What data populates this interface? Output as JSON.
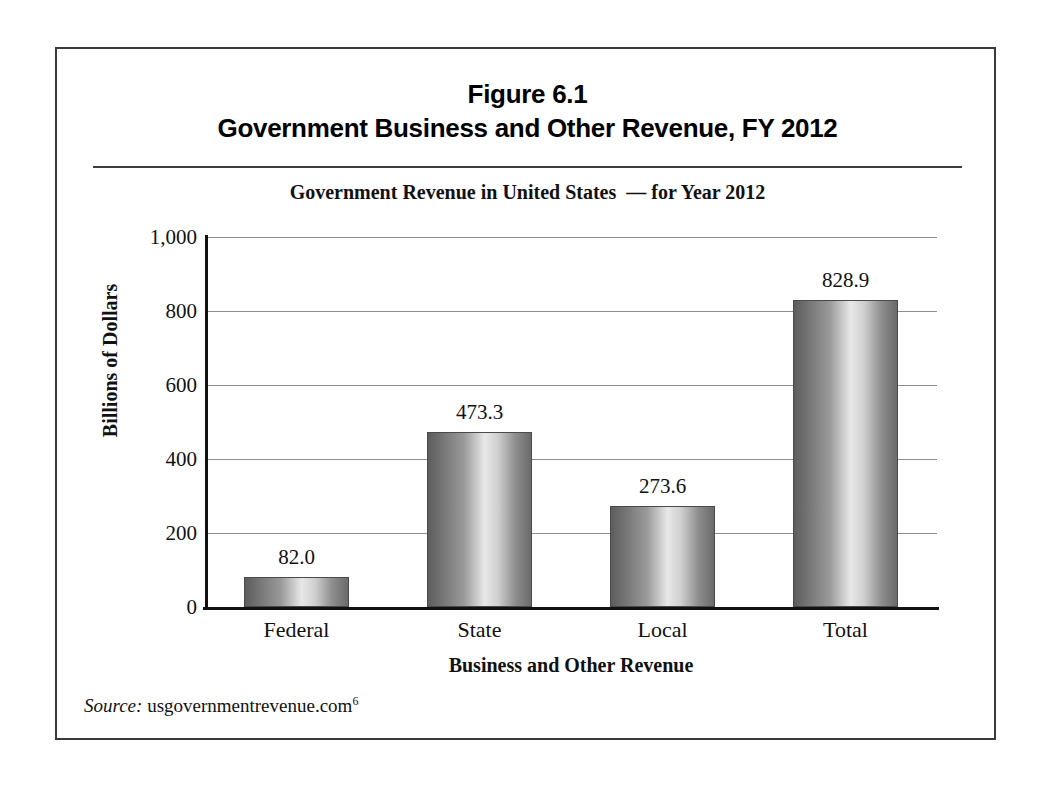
{
  "figure": {
    "title_line1": "Figure 6.1",
    "title_line2": "Government Business and Other Revenue, FY 2012",
    "source_label": "Source:",
    "source_text": " usgovernmentrevenue.com",
    "source_footnote": "6"
  },
  "chart_data": {
    "type": "bar",
    "title": "Government Revenue in United States  — for Year 2012",
    "xlabel": "Business and Other Revenue",
    "ylabel": "Billions of Dollars",
    "categories": [
      "Federal",
      "State",
      "Local",
      "Total"
    ],
    "values": [
      82.0,
      473.3,
      273.6,
      828.9
    ],
    "value_labels": [
      "82.0",
      "473.3",
      "273.6",
      "828.9"
    ],
    "ylim": [
      0,
      1000
    ],
    "yticks": [
      0,
      200,
      400,
      600,
      800,
      1000
    ],
    "ytick_labels": [
      "0",
      "200",
      "400",
      "600",
      "800",
      "1,000"
    ],
    "grid": "horizontal",
    "legend": "none",
    "bar_fill": "#9a9a9a",
    "bar_outline": "#4a4a4a",
    "gridline_color": "#8e8e8e",
    "axis_color": "#111111"
  }
}
